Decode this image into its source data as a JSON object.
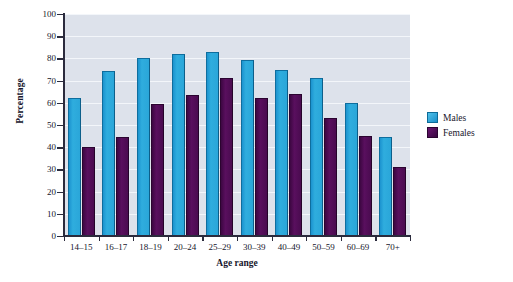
{
  "chart_data": {
    "type": "bar",
    "title": "",
    "xlabel": "Age range",
    "ylabel": "Percentage",
    "categories": [
      "14–15",
      "16–17",
      "18–19",
      "20–24",
      "25–29",
      "30–39",
      "40–49",
      "50–59",
      "60–69",
      "70+"
    ],
    "series": [
      {
        "name": "Males",
        "color": "#2aa6d9",
        "values": [
          62,
          74.5,
          80,
          82,
          83,
          79.5,
          75,
          71,
          60,
          44.5
        ]
      },
      {
        "name": "Females",
        "color": "#4a0b50",
        "values": [
          40,
          44.5,
          59.5,
          63.5,
          71,
          62,
          64,
          53,
          45,
          31
        ]
      }
    ],
    "ylim": [
      0,
      100
    ],
    "yticks": [
      0,
      10,
      20,
      30,
      40,
      50,
      60,
      70,
      80,
      90,
      100
    ],
    "ytick_labels": [
      "0",
      "10",
      "20",
      "30",
      "40",
      "50",
      "60",
      "70",
      "80",
      "90",
      "100"
    ],
    "grid": true,
    "grid_axis": "y",
    "legend_position": "right",
    "plot_background": "#dde2eb",
    "figure_background": "#ffffff"
  },
  "legend": {
    "items": [
      {
        "label": "Males",
        "swatch": "males"
      },
      {
        "label": "Females",
        "swatch": "females"
      }
    ]
  }
}
